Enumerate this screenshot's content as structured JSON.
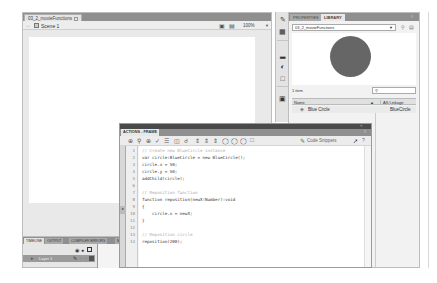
{
  "document": {
    "tab_label": "03_2_movieFunctions",
    "scene_label": "Scene 1",
    "zoom_value": "100%",
    "icons": [
      "back-arrow-icon",
      "scene-icon",
      "edit-symbols-icon",
      "edit-scene-icon"
    ]
  },
  "timeline": {
    "tabs": [
      "TIMELINE",
      "OUTPUT",
      "COMPILER ERRORS",
      "M"
    ],
    "frame_number": "1",
    "layer_name": "Layer 1"
  },
  "tools": [
    "properties-icon",
    "library-icon",
    "align-icon",
    "color-icon",
    "transform-icon",
    "components-icon"
  ],
  "library": {
    "tabs": [
      "PROPERTIES",
      "LIBRARY"
    ],
    "document_select": "03_2_movieFunctions",
    "item_count": "1 item",
    "search_placeholder": "",
    "columns": {
      "name": "Name",
      "linkage": "AS Linkage"
    },
    "items": [
      {
        "name": "Blue Circle",
        "linkage": "BlueCircle"
      }
    ],
    "preview_color": "#666666"
  },
  "actions": {
    "tab_label": "ACTIONS - FRAME",
    "snippets_label": "Code Snippets",
    "code_lines": [
      {
        "n": "1",
        "text": "// Create new BlueCircle instance",
        "comment": true
      },
      {
        "n": "2",
        "text": "var circle:BlueCircle = new BlueCircle();",
        "comment": false
      },
      {
        "n": "3",
        "text": "circle.x = 50;",
        "comment": false
      },
      {
        "n": "4",
        "text": "circle.y = 50;",
        "comment": false
      },
      {
        "n": "5",
        "text": "addChild(circle);",
        "comment": false
      },
      {
        "n": "6",
        "text": "",
        "comment": false
      },
      {
        "n": "7",
        "text": "// Reposition function",
        "comment": true
      },
      {
        "n": "8",
        "text": "function reposition(newX:Number):void",
        "comment": false
      },
      {
        "n": "9",
        "text": "{",
        "comment": false
      },
      {
        "n": "10",
        "text": "    circle.x = newX;",
        "comment": false
      },
      {
        "n": "11",
        "text": "}",
        "comment": false
      },
      {
        "n": "12",
        "text": "",
        "comment": false
      },
      {
        "n": "13",
        "text": "// Reposition circle",
        "comment": true
      },
      {
        "n": "14",
        "text": "reposition(200);",
        "comment": false
      }
    ]
  }
}
